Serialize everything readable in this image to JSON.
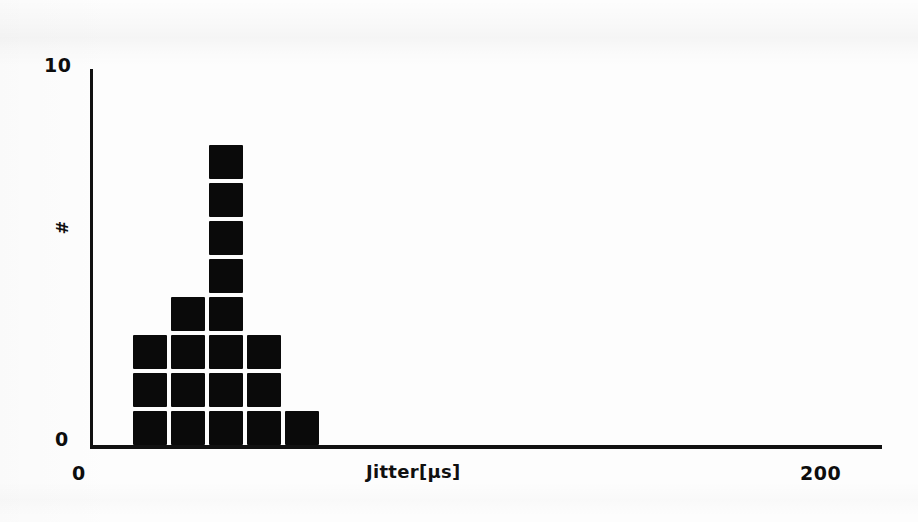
{
  "figure": {
    "background_color": "#fdfdfd",
    "ink_color": "#0a0a0a",
    "axis_color": "#111111"
  },
  "axes": {
    "y_axis_title": "#",
    "x_axis_title": "Jitter[µs]",
    "y_ticks": [
      "0",
      "10"
    ],
    "x_ticks": [
      "0",
      "200"
    ],
    "y_tick_top_label": "10",
    "y_tick_bottom_label": "0",
    "x_tick_left_label": "0",
    "x_tick_right_label": "200"
  },
  "chart_data": {
    "type": "bar",
    "title": "",
    "subtitle": "",
    "xlabel": "Jitter[µs]",
    "ylabel": "#",
    "xlim": [
      0,
      200
    ],
    "ylim": [
      0,
      10
    ],
    "grid": false,
    "legend": null,
    "style": "stacked-square dot histogram (each square = 1 count)",
    "bin_width": 9.6,
    "categories": [
      "10.4",
      "20.0",
      "29.6",
      "39.2",
      "48.8"
    ],
    "x": [
      10.4,
      20.0,
      29.6,
      39.2,
      48.8
    ],
    "values": [
      3,
      4,
      8,
      3,
      1
    ],
    "series": [
      {
        "name": "Jitter counts",
        "values": [
          3,
          4,
          8,
          3,
          1
        ]
      }
    ],
    "annotations": []
  },
  "geometry": {
    "plot_left_px": 92,
    "plot_right_px": 882,
    "baseline_px": 445,
    "block_size_px": 34,
    "block_pitch_x_px": 38,
    "block_pitch_y_px": 38,
    "first_block_left_px": 133
  }
}
